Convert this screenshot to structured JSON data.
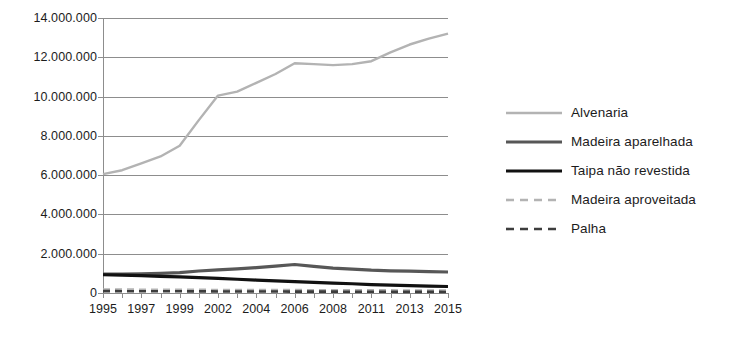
{
  "chart_data": {
    "type": "line",
    "title": "",
    "subtitle": "",
    "xlabel": "",
    "ylabel": "",
    "grid": true,
    "legend_position": "right",
    "ylim": [
      0,
      14000000
    ],
    "y_ticks": [
      0,
      2000000,
      4000000,
      6000000,
      8000000,
      10000000,
      12000000,
      14000000
    ],
    "y_tick_labels": [
      "0",
      "2.000.000",
      "4.000.000",
      "6.000.000",
      "8.000.000",
      "10.000.000",
      "12.000.000",
      "14.000.000"
    ],
    "x": [
      "1995",
      "1996",
      "1997",
      "1998",
      "1999",
      "2001",
      "2002",
      "2003",
      "2004",
      "2005",
      "2006",
      "2007",
      "2008",
      "2009",
      "2011",
      "2012",
      "2013",
      "2014",
      "2015"
    ],
    "x_tick_labels": [
      "1995",
      "1997",
      "1999",
      "2002",
      "2004",
      "2006",
      "2008",
      "2011",
      "2013",
      "2015"
    ],
    "x_tick_label_indices": [
      0,
      2,
      4,
      6,
      8,
      10,
      12,
      14,
      16,
      18
    ],
    "series": [
      {
        "name": "Alvenaria",
        "color": "#b3b3b3",
        "style": "solid",
        "width": 2.4,
        "values": [
          6050000,
          6250000,
          6600000,
          6950000,
          7500000,
          8800000,
          10050000,
          10250000,
          10700000,
          11150000,
          11700000,
          11650000,
          11600000,
          11650000,
          11800000,
          12250000,
          12650000,
          12950000,
          13200000
        ]
      },
      {
        "name": "Madeira aparelhada",
        "color": "#575757",
        "style": "solid",
        "width": 3.2,
        "values": [
          960000,
          960000,
          980000,
          1000000,
          1040000,
          1120000,
          1180000,
          1230000,
          1290000,
          1370000,
          1450000,
          1360000,
          1270000,
          1220000,
          1160000,
          1130000,
          1110000,
          1090000,
          1070000
        ]
      },
      {
        "name": "Taipa não revestida",
        "color": "#111111",
        "style": "solid",
        "width": 3.2,
        "values": [
          930000,
          910000,
          880000,
          850000,
          820000,
          780000,
          740000,
          700000,
          660000,
          620000,
          580000,
          540000,
          500000,
          470000,
          430000,
          400000,
          375000,
          350000,
          330000
        ]
      },
      {
        "name": "Madeira aproveitada",
        "color": "#b3b3b3",
        "style": "dashed",
        "width": 2.6,
        "values": [
          175000,
          172000,
          168000,
          165000,
          162000,
          158000,
          155000,
          152000,
          150000,
          148000,
          145000,
          142000,
          140000,
          138000,
          135000,
          132000,
          130000,
          128000,
          125000
        ]
      },
      {
        "name": "Palha",
        "color": "#3d3d3d",
        "style": "dashed",
        "width": 2.6,
        "values": [
          95000,
          92000,
          90000,
          88000,
          86000,
          83000,
          80000,
          78000,
          76000,
          74000,
          72000,
          70000,
          68000,
          66000,
          63000,
          60000,
          58000,
          56000,
          54000
        ]
      }
    ]
  },
  "legend": {
    "items": [
      {
        "label": "Alvenaria"
      },
      {
        "label": "Madeira aparelhada"
      },
      {
        "label": "Taipa não revestida"
      },
      {
        "label": "Madeira aproveitada"
      },
      {
        "label": "Palha"
      }
    ]
  },
  "colors": {
    "grid": "#8d8d8d",
    "axis": "#8d8d8d",
    "text": "#1c1c1c",
    "background": "#ffffff"
  }
}
